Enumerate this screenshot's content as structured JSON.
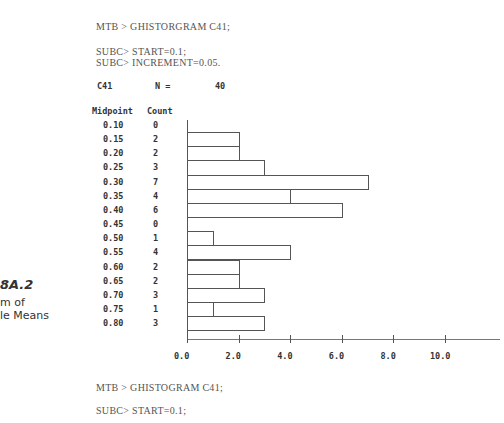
{
  "session_top": {
    "cmd": "MTB > GHISTORGRAM C41;",
    "sub1": "SUBC> START=0.1;",
    "sub2": "SUBC> INCREMENT=0.05."
  },
  "summary": {
    "column": "C41",
    "n_label": "N =",
    "n_value": "40"
  },
  "table_headers": {
    "midpoint": "Midpoint",
    "count": "Count"
  },
  "caption": {
    "number": "8A.2",
    "line1": "m of",
    "line2": "le Means"
  },
  "session_bottom": {
    "cmd": "MTB > GHISTOGRAM C41;",
    "sub1": "SUBC> START=0.1;"
  },
  "chart_data": {
    "type": "bar",
    "orientation": "horizontal",
    "xlabel": "Count",
    "ylabel": "Midpoint",
    "categories": [
      "0.10",
      "0.15",
      "0.20",
      "0.25",
      "0.30",
      "0.35",
      "0.40",
      "0.45",
      "0.50",
      "0.55",
      "0.60",
      "0.65",
      "0.70",
      "0.75",
      "0.80"
    ],
    "values": [
      0,
      2,
      2,
      3,
      7,
      4,
      6,
      0,
      1,
      4,
      2,
      2,
      3,
      1,
      3
    ],
    "xticks": [
      "0.0",
      "2.0",
      "4.0",
      "6.0",
      "8.0",
      "10.0"
    ],
    "xlim": [
      0,
      12
    ],
    "grid": false,
    "n": 40
  }
}
